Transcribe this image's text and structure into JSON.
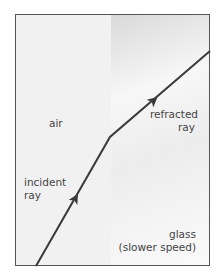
{
  "diagram": {
    "regions": [
      {
        "name": "air",
        "label": "air"
      },
      {
        "name": "glass",
        "label_line1": "glass",
        "label_line2": "(slower speed)"
      }
    ],
    "rays": {
      "incident": {
        "label_line1": "incident",
        "label_line2": "ray"
      },
      "refracted": {
        "label_line1": "refracted",
        "label_line2": "ray"
      }
    },
    "colors": {
      "ray": "#3a3a3a",
      "border": "#555555",
      "text": "#444444"
    }
  }
}
